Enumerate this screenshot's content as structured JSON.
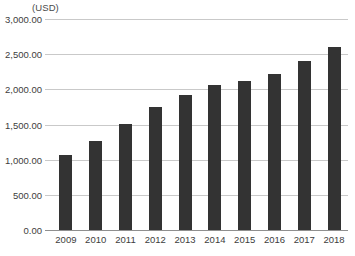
{
  "chart_data": {
    "type": "bar",
    "title": "",
    "subtitle": "",
    "xlabel": "",
    "ylabel": "(USD)",
    "unit_caption": "(USD)",
    "categories": [
      "2009",
      "2010",
      "2011",
      "2012",
      "2013",
      "2014",
      "2015",
      "2016",
      "2017",
      "2018"
    ],
    "values": [
      1060,
      1270,
      1510,
      1750,
      1915,
      2060,
      2115,
      2225,
      2400,
      2600
    ],
    "series": [
      {
        "name": "",
        "values": [
          1060,
          1270,
          1510,
          1750,
          1915,
          2060,
          2115,
          2225,
          2400,
          2600
        ]
      }
    ],
    "ylim": [
      0,
      3000
    ],
    "ytick_values": [
      0,
      500,
      1000,
      1500,
      2000,
      2500,
      3000
    ],
    "ytick_labels": [
      "0.00",
      "500.00",
      "1,000.00",
      "1,500.00",
      "2,000.00",
      "2,500.00",
      "3,000.00"
    ],
    "grid": true,
    "grid_axis": "y",
    "legend": false,
    "legend_position": "none",
    "bar_color": "#333333",
    "gridline_color": "#c9c9c9",
    "axis_color": "#8f8f8f",
    "background_color": "#ffffff",
    "annotations": []
  }
}
